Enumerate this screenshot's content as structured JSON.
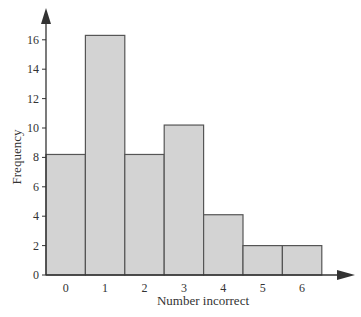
{
  "chart_data": {
    "type": "bar",
    "subtype": "histogram",
    "title": "",
    "xlabel": "Number incorrect",
    "ylabel": "Frequency",
    "categories": [
      "0",
      "1",
      "2",
      "3",
      "4",
      "5",
      "6"
    ],
    "values": [
      8.2,
      16.3,
      8.2,
      10.2,
      4.1,
      2.0,
      2.0
    ],
    "yticks": [
      0,
      2,
      4,
      6,
      8,
      10,
      12,
      14,
      16
    ],
    "ylim": [
      0,
      18
    ],
    "grid": false,
    "legend": null,
    "colors": {
      "bar_fill": "#d3d3d3",
      "bar_stroke": "#555555",
      "axis": "#333333"
    }
  }
}
